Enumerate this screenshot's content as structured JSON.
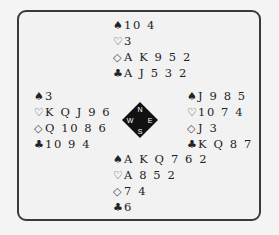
{
  "diagram": {
    "type": "bridge-deal",
    "compass": {
      "north": "N",
      "south": "S",
      "east": "E",
      "west": "W"
    },
    "suit_symbols": {
      "spades": "♠",
      "hearts": "♡",
      "diamonds": "◇",
      "clubs": "♣"
    },
    "hands": {
      "north": {
        "spades": "10 4",
        "hearts": "3",
        "diamonds": "A K 9 5 2",
        "clubs": "A J 5 3 2"
      },
      "west": {
        "spades": "3",
        "hearts": "K Q J 9 6",
        "diamonds": "Q 10 8 6",
        "clubs": "10 9 4"
      },
      "east": {
        "spades": "J 9 8 5",
        "hearts": "10 7 4",
        "diamonds": "J 3",
        "clubs": "K Q 8 7"
      },
      "south": {
        "spades": "A K Q 7 6 2",
        "hearts": "A 8 5 2",
        "diamonds": "7 4",
        "clubs": "6"
      }
    }
  }
}
